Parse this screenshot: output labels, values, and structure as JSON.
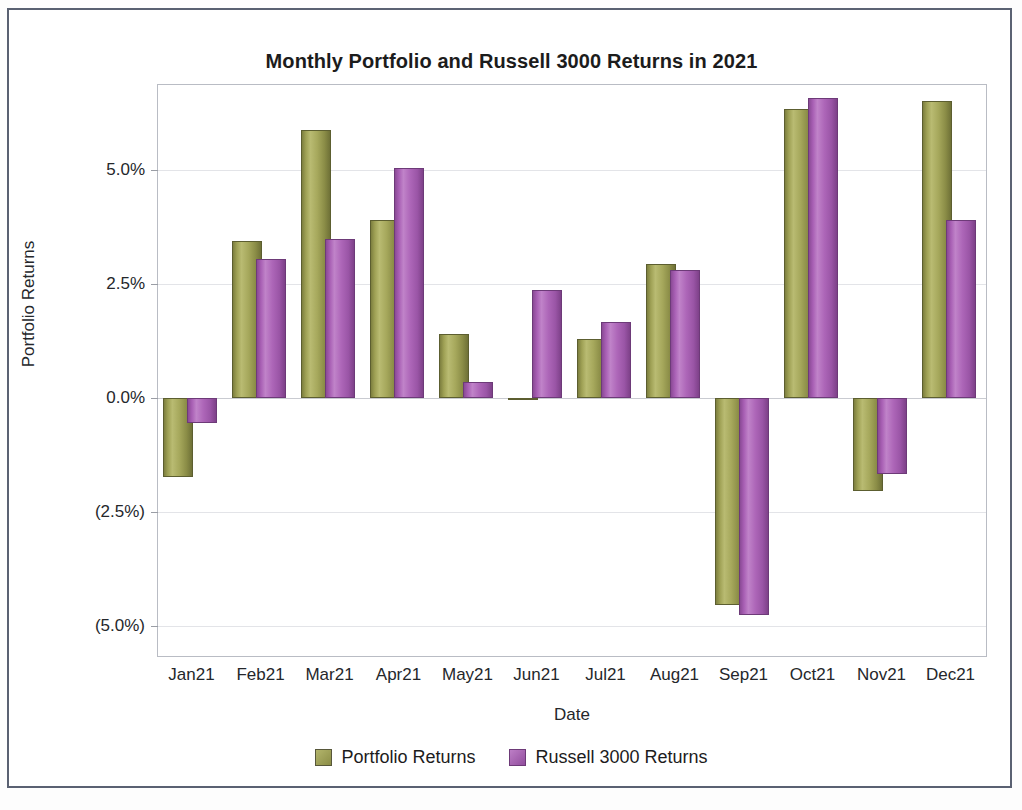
{
  "chart_data": {
    "type": "bar",
    "title": "Monthly Portfolio and Russell 3000 Returns in 2021",
    "xlabel": "Date",
    "ylabel": "Portfolio Returns",
    "categories": [
      "Jan21",
      "Feb21",
      "Mar21",
      "Apr21",
      "May21",
      "Jun21",
      "Jul21",
      "Aug21",
      "Sep21",
      "Oct21",
      "Nov21",
      "Dec21"
    ],
    "ytick_labels": [
      "5.0%",
      "2.5%",
      "0.0%",
      "(2.5%)",
      "(5.0%)"
    ],
    "ytick_values": [
      5.0,
      2.5,
      0.0,
      -2.5,
      -5.0
    ],
    "ylim": [
      -5.65,
      6.85
    ],
    "grid": true,
    "legend_position": "bottom",
    "series": [
      {
        "name": "Portfolio Returns",
        "color": "#9a9c4e",
        "values": [
          -1.73,
          3.44,
          5.87,
          3.9,
          1.39,
          -0.05,
          1.29,
          2.94,
          -4.54,
          6.33,
          -2.04,
          6.5
        ]
      },
      {
        "name": "Russell 3000 Returns",
        "color": "#a55fb0",
        "values": [
          -0.56,
          3.04,
          3.48,
          5.04,
          0.35,
          2.37,
          1.67,
          2.79,
          -4.75,
          6.56,
          -1.67,
          3.9
        ]
      }
    ]
  }
}
